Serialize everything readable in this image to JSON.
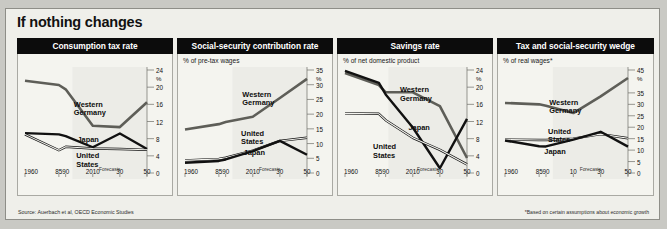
{
  "title": "If nothing changes",
  "source_note": "Source: Auerbach et al, OECD Economic Studies",
  "footnote": "*Based on certain assumptions about economic growth",
  "forecast_label": "Forecasts",
  "series_names": {
    "wg": "Western\nGermany",
    "us": "United\nStates",
    "jp": "Japan"
  },
  "chart_data": [
    {
      "type": "line",
      "title": "Consumption tax rate",
      "subtitle": "",
      "xlabel": "",
      "ylabel": "%",
      "ylim": [
        0,
        24
      ],
      "yticks": [
        0,
        4,
        8,
        12,
        16,
        20,
        24
      ],
      "xticks": [
        "1960",
        "85",
        "90",
        "2010",
        "30",
        "50"
      ],
      "xtick_positions": [
        1960,
        1985,
        1990,
        2010,
        2030,
        2050
      ],
      "grid": false,
      "forecast_start": 1995,
      "legend_position": "inline-annotation",
      "series": [
        {
          "name": "Western Germany",
          "x": [
            1960,
            1985,
            1990,
            2010,
            2030,
            2050
          ],
          "values": [
            21.5,
            20.5,
            19.5,
            11.0,
            10.7,
            16.5
          ]
        },
        {
          "name": "Japan",
          "x": [
            1960,
            1985,
            1990,
            2010,
            2030,
            2050
          ],
          "values": [
            9.3,
            9.0,
            8.6,
            6.0,
            9.2,
            5.6
          ]
        },
        {
          "name": "United States",
          "x": [
            1960,
            1985,
            1990,
            2010,
            2030,
            2050
          ],
          "values": [
            9.0,
            5.3,
            6.1,
            5.7,
            5.6,
            5.4
          ]
        }
      ]
    },
    {
      "type": "line",
      "title": "Social-security contribution rate",
      "subtitle": "% of pre-tax wages",
      "xlabel": "",
      "ylabel": "%",
      "ylim": [
        0,
        35
      ],
      "yticks": [
        0,
        5,
        10,
        15,
        20,
        25,
        30,
        35
      ],
      "xticks": [
        "1960",
        "85",
        "90",
        "2010",
        "30",
        "50"
      ],
      "xtick_positions": [
        1960,
        1985,
        1990,
        2010,
        2030,
        2050
      ],
      "grid": false,
      "forecast_start": 1995,
      "legend_position": "inline-annotation",
      "series": [
        {
          "name": "Western Germany",
          "x": [
            1960,
            1985,
            1990,
            2010,
            2030,
            2050
          ],
          "values": [
            14.8,
            16.6,
            17.3,
            19.1,
            25.5,
            32.0
          ]
        },
        {
          "name": "United States",
          "x": [
            1960,
            1985,
            1990,
            2010,
            2030,
            2050
          ],
          "values": [
            4.3,
            4.8,
            5.2,
            7.6,
            10.9,
            12.0
          ]
        },
        {
          "name": "Japan",
          "x": [
            1960,
            1985,
            1990,
            2010,
            2030,
            2050
          ],
          "values": [
            3.5,
            4.1,
            4.6,
            7.4,
            10.9,
            6.2
          ]
        }
      ]
    },
    {
      "type": "line",
      "title": "Savings rate",
      "subtitle": "% of net domestic product",
      "xlabel": "",
      "ylabel": "%",
      "ylim": [
        0,
        24
      ],
      "yticks": [
        0,
        4,
        8,
        12,
        16,
        20,
        24
      ],
      "xticks": [
        "1960",
        "85",
        "90",
        "2010",
        "30",
        "50"
      ],
      "xtick_positions": [
        1960,
        1985,
        1990,
        2010,
        2030,
        2050
      ],
      "grid": false,
      "forecast_start": 1992,
      "legend_position": "inline-annotation",
      "series": [
        {
          "name": "Western Germany",
          "x": [
            1960,
            1985,
            1990,
            2010,
            2030,
            2050
          ],
          "values": [
            23.3,
            20.5,
            18.8,
            18.8,
            15.6,
            3.5
          ]
        },
        {
          "name": "Japan",
          "x": [
            1960,
            1985,
            1990,
            2010,
            2030,
            2050
          ],
          "values": [
            23.8,
            21.0,
            18.3,
            10.6,
            1.1,
            12.6
          ]
        },
        {
          "name": "United States",
          "x": [
            1960,
            1985,
            1990,
            2010,
            2030,
            2050
          ],
          "values": [
            13.9,
            13.8,
            12.3,
            8.2,
            5.4,
            2.0
          ]
        }
      ]
    },
    {
      "type": "line",
      "title": "Tax and social-security wedge",
      "subtitle": "% of real wages*",
      "xlabel": "",
      "ylabel": "%",
      "ylim": [
        0,
        45
      ],
      "yticks": [
        0,
        5,
        10,
        15,
        20,
        25,
        30,
        35,
        45
      ],
      "xticks": [
        "1960",
        "85",
        "90",
        "10",
        "30",
        "50"
      ],
      "xtick_positions": [
        1960,
        1985,
        1990,
        2010,
        2030,
        2050
      ],
      "grid": false,
      "forecast_start": 1995,
      "legend_position": "inline-annotation",
      "series": [
        {
          "name": "Western Germany",
          "x": [
            1960,
            1985,
            1990,
            2010,
            2030,
            2050
          ],
          "values": [
            30.6,
            30.0,
            29.4,
            26.2,
            33.5,
            41.5
          ]
        },
        {
          "name": "United States",
          "x": [
            1960,
            1985,
            1990,
            2010,
            2030,
            2050
          ],
          "values": [
            14.6,
            14.4,
            14.4,
            15.0,
            17.0,
            15.2
          ]
        },
        {
          "name": "Japan",
          "x": [
            1960,
            1985,
            1990,
            2010,
            2030,
            2050
          ],
          "values": [
            14.2,
            11.7,
            11.6,
            14.6,
            18.0,
            11.5
          ]
        }
      ]
    }
  ]
}
